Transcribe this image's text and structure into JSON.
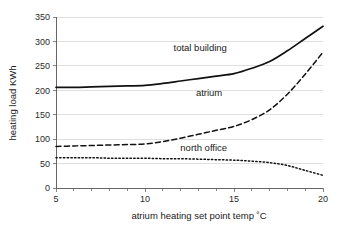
{
  "chart_data": {
    "type": "line",
    "title": "",
    "xlabel": "atrium heating set point temp ˚C",
    "ylabel": "heating load KWh",
    "xlim": [
      5,
      20
    ],
    "ylim": [
      0,
      350
    ],
    "xticks": [
      5,
      10,
      15,
      20
    ],
    "xtick_labels": [
      "5",
      "10",
      "15",
      "20"
    ],
    "xminor_ticks": [
      6,
      7,
      8,
      9,
      11,
      12,
      13,
      14,
      16,
      17,
      18,
      19
    ],
    "yticks": [
      0,
      50,
      100,
      150,
      200,
      250,
      300,
      350
    ],
    "ytick_labels": [
      "0",
      "50",
      "100",
      "150",
      "200",
      "250",
      "300",
      "350"
    ],
    "grid": "horizontal",
    "legend_position": "inline-annotations",
    "x": [
      5,
      6,
      7,
      8,
      9,
      10,
      11,
      12,
      13,
      14,
      15,
      16,
      17,
      18,
      19,
      20
    ],
    "series": [
      {
        "name": "total building",
        "style": "solid",
        "color": "#111111",
        "width": 1.7,
        "label_x": 13.1,
        "label_y": 288,
        "values": [
          206,
          206,
          207,
          208,
          209,
          210,
          214,
          219,
          224,
          229,
          234,
          245,
          259,
          281,
          306,
          331
        ]
      },
      {
        "name": "atrium",
        "style": "dashed",
        "color": "#111111",
        "width": 1.5,
        "label_x": 13.6,
        "label_y": 196,
        "values": [
          85,
          86,
          87,
          88,
          89,
          90,
          95,
          102,
          110,
          118,
          126,
          140,
          160,
          192,
          233,
          278
        ]
      },
      {
        "name": "north office",
        "style": "dotted",
        "color": "#111111",
        "width": 1.5,
        "label_x": 13.3,
        "label_y": 82,
        "values": [
          62,
          62,
          62,
          61,
          61,
          61,
          60,
          60,
          59,
          58,
          57,
          55,
          52,
          46,
          36,
          26
        ]
      }
    ]
  },
  "geometry": {
    "plot_left": 56,
    "plot_right": 323,
    "plot_top": 17,
    "plot_bottom": 188
  }
}
